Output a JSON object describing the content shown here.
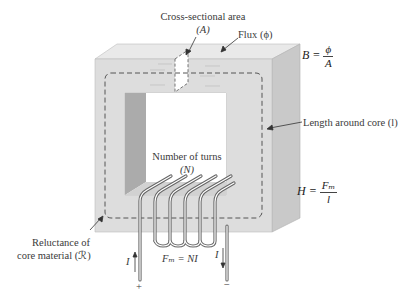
{
  "labels": {
    "cross_section": "Cross-sectional area",
    "cross_section_symbol": "(A)",
    "flux": "Flux (ϕ)",
    "length": "Length around core (l)",
    "turns": "Number of turns",
    "turns_symbol": "(N)",
    "reluctance_line1": "Reluctance of",
    "reluctance_line2": "core material (ℛ)",
    "mmf": "Fₘ = NI",
    "current_left": "I",
    "current_right": "I",
    "plus": "+",
    "minus": "−"
  },
  "equations": {
    "flux_density": {
      "lhs": "B =",
      "num": "ϕ",
      "den": "A"
    },
    "field_intensity": {
      "lhs": "H =",
      "num": "Fₘ",
      "den": "l"
    }
  },
  "colors": {
    "core_front": "#dcdcdc",
    "core_top": "#e8e8e8",
    "core_side": "#c6c6c6",
    "inner_wall": "#a9a9a9",
    "dashed_path": "#555555",
    "wire": "#666666"
  }
}
